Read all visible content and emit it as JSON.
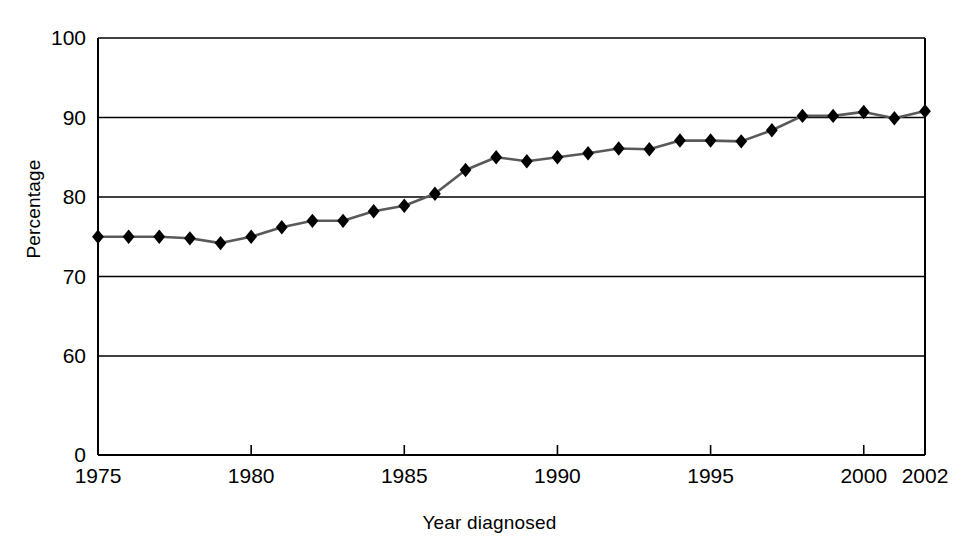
{
  "chart_data": {
    "type": "line",
    "title": "",
    "subtitle": "",
    "xlabel": "Year diagnosed",
    "ylabel": "Percentage",
    "x": [
      1975,
      1976,
      1977,
      1978,
      1979,
      1980,
      1981,
      1982,
      1983,
      1984,
      1985,
      1986,
      1987,
      1988,
      1989,
      1990,
      1991,
      1992,
      1993,
      1994,
      1995,
      1996,
      1997,
      1998,
      1999,
      2000,
      2001,
      2002
    ],
    "values": [
      75.0,
      75.0,
      75.0,
      74.8,
      74.2,
      75.0,
      76.2,
      77.0,
      77.0,
      78.2,
      78.9,
      80.4,
      83.4,
      85.0,
      84.5,
      85.0,
      85.5,
      86.1,
      86.0,
      87.1,
      87.1,
      87.0,
      88.4,
      90.2,
      90.2,
      90.7,
      89.9,
      90.8
    ],
    "series": [
      {
        "name": "Percentage",
        "values": [
          75.0,
          75.0,
          75.0,
          74.8,
          74.2,
          75.0,
          76.2,
          77.0,
          77.0,
          78.2,
          78.9,
          80.4,
          83.4,
          85.0,
          84.5,
          85.0,
          85.5,
          86.1,
          86.0,
          87.1,
          87.1,
          87.0,
          88.4,
          90.2,
          90.2,
          90.7,
          89.9,
          90.8
        ],
        "color": "#1a1a1a",
        "marker": "diamond"
      }
    ],
    "yticks": [
      0,
      60,
      70,
      80,
      90,
      100
    ],
    "ytick_labels": [
      "0",
      "60",
      "70",
      "80",
      "90",
      "100"
    ],
    "xticks": [
      1975,
      1980,
      1985,
      1990,
      1995,
      2000,
      2002
    ],
    "xtick_labels": [
      "1975",
      "1980",
      "1985",
      "1990",
      "1995",
      "2000",
      "2002"
    ],
    "xlim": [
      1975,
      2002
    ],
    "ylim_note": "broken y-axis: 0 then 60-100",
    "grid": "horizontal",
    "legend": "none",
    "line_color": "#595959",
    "marker_color": "#000000",
    "axis_color": "#000000"
  }
}
